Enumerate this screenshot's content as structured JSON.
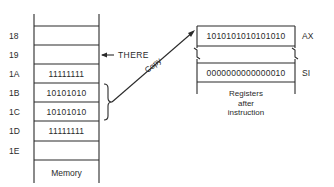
{
  "memory": {
    "caption": "Memory",
    "rows": [
      {
        "address": "18",
        "value": ""
      },
      {
        "address": "19",
        "value": ""
      },
      {
        "address": "1A",
        "value": "11111111"
      },
      {
        "address": "1B",
        "value": "10101010"
      },
      {
        "address": "1C",
        "value": "10101010"
      },
      {
        "address": "1D",
        "value": "11111111"
      },
      {
        "address": "1E",
        "value": ""
      }
    ],
    "pointer_label": "THERE"
  },
  "copy_arrow": {
    "label": "Copy"
  },
  "registers": {
    "caption_lines": [
      "Registers",
      "after",
      "instruction"
    ],
    "items": [
      {
        "name": "AX",
        "value": "1010101010101010"
      },
      {
        "name": "SI",
        "value": "0000000000000010"
      }
    ]
  },
  "colors": {
    "line": "#2a2a2a",
    "background": "#ffffff"
  }
}
